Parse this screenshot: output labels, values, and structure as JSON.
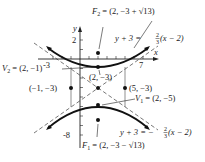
{
  "diagram": {
    "type": "hyperbola-graph",
    "axes": {
      "x_label": "x",
      "y_label": "y",
      "x_ticks": [
        "-3",
        "7"
      ],
      "y_ticks": [
        "2",
        "-8"
      ]
    },
    "points": {
      "F2": {
        "label": "F",
        "sub": "2",
        "value": " = (2, −3 + √13)"
      },
      "V2": {
        "label": "V",
        "sub": "2",
        "value": " = (2, −1)"
      },
      "center": {
        "label": "(2, −3)"
      },
      "left": {
        "label": "(−1, −3)"
      },
      "right": {
        "label": "(5, −3)"
      },
      "V1": {
        "label": "V",
        "sub": "1",
        "value": " = (2, −5)"
      },
      "F1": {
        "label": "F",
        "sub": "1",
        "value": " = (2, −3 − √13)"
      }
    },
    "asymptotes": {
      "upper": {
        "lhs": "y + 3 = ",
        "num": "2",
        "den": "3",
        "rhs": "(x − 2)"
      },
      "lower": {
        "lhs": "y + 3 = −",
        "num": "2",
        "den": "3",
        "rhs": "(x − 2)"
      }
    }
  }
}
